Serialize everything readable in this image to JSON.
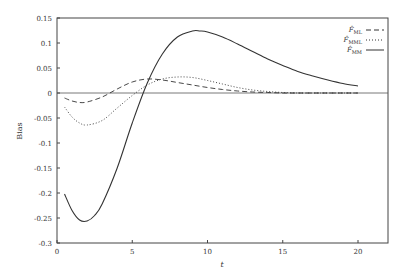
{
  "chart_data": {
    "type": "line",
    "title": "",
    "xlabel": "t",
    "ylabel": "Bias",
    "xlim": [
      0,
      22
    ],
    "ylim": [
      -0.3,
      0.15
    ],
    "xticks": [
      0,
      5,
      10,
      15,
      20
    ],
    "yticks": [
      0.15,
      0.1,
      0.05,
      0,
      -0.05,
      -0.1,
      -0.15,
      -0.2,
      -0.25,
      -0.3
    ],
    "xtick_labels": [
      "0",
      "5",
      "10",
      "15",
      "20"
    ],
    "ytick_labels": [
      "0.15",
      "0.1",
      "0.05",
      "0",
      "-0.05",
      "-0.1",
      "-0.15",
      "-0.2",
      "-0.25",
      "-0.3"
    ],
    "grid": false,
    "zero_line": true,
    "legend_position": "upper right",
    "series": [
      {
        "name": "F̂_ML",
        "style": "dashed",
        "x": [
          0.5,
          1,
          1.5,
          2,
          3,
          4,
          5,
          6,
          7,
          8,
          9,
          10,
          11,
          12,
          13,
          14,
          15,
          16,
          17,
          18,
          19,
          20
        ],
        "values": [
          -0.01,
          -0.016,
          -0.019,
          -0.018,
          -0.008,
          0.008,
          0.022,
          0.028,
          0.026,
          0.021,
          0.016,
          0.011,
          0.007,
          0.004,
          0.002,
          0.001,
          0.0,
          0.0,
          0.0,
          0.0,
          0.0,
          0.0
        ]
      },
      {
        "name": "F̂_MML",
        "style": "dotted",
        "x": [
          0.5,
          1,
          1.5,
          2,
          3,
          4,
          5,
          6,
          7,
          8,
          9,
          10,
          11,
          12,
          13,
          14,
          15,
          16,
          17,
          18,
          19,
          20
        ],
        "values": [
          -0.028,
          -0.048,
          -0.06,
          -0.064,
          -0.055,
          -0.03,
          -0.005,
          0.016,
          0.028,
          0.032,
          0.031,
          0.025,
          0.018,
          0.011,
          0.006,
          0.003,
          0.001,
          0.0,
          0.0,
          0.0,
          0.0,
          0.0
        ]
      },
      {
        "name": "F̂_MM",
        "style": "solid",
        "x": [
          0.5,
          1,
          1.5,
          2,
          2.5,
          3,
          4,
          5,
          6,
          7,
          8,
          9,
          9.5,
          10,
          11,
          12,
          13,
          14,
          15,
          16,
          17,
          18,
          19,
          20
        ],
        "values": [
          -0.202,
          -0.235,
          -0.254,
          -0.256,
          -0.245,
          -0.222,
          -0.15,
          -0.06,
          0.02,
          0.078,
          0.112,
          0.124,
          0.124,
          0.122,
          0.112,
          0.098,
          0.083,
          0.068,
          0.055,
          0.043,
          0.034,
          0.026,
          0.019,
          0.014
        ]
      }
    ]
  },
  "legend": {
    "items": [
      {
        "main": "F̂",
        "sub": "ML",
        "style": "dashed"
      },
      {
        "main": "F̂",
        "sub": "MML",
        "style": "dotted"
      },
      {
        "main": "F̂",
        "sub": "MM",
        "style": "solid"
      }
    ]
  }
}
